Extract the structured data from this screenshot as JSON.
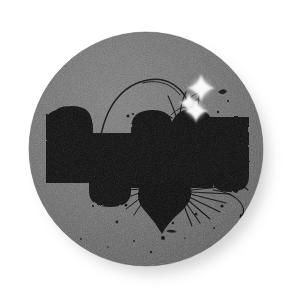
{
  "artwork": {
    "title": "numu",
    "kind": "grunge-sticker-badge",
    "wordmark": "numu",
    "letters": [
      {
        "glyph": "n",
        "name": "letter-n"
      },
      {
        "glyph": "u",
        "name": "letter-u-first"
      },
      {
        "glyph": "m",
        "name": "letter-m"
      },
      {
        "glyph": "u",
        "name": "letter-u-second"
      }
    ],
    "background_color": "#ffffff",
    "badge_color": "#6d6d6d",
    "badge_color_light": "#7b7b7b",
    "badge_color_dark": "#5c5c5c",
    "ink_color": "#0b0b0b",
    "sparkle_color": "#ffffff",
    "shadow_color": "#c9c9c9",
    "badge": {
      "center_x": 146,
      "center_y": 149,
      "radius": 117
    },
    "shadow": {
      "offset_x": 8,
      "offset_y": 10,
      "blur": 9
    },
    "ornaments": [
      {
        "name": "vine-arc",
        "description": "thin curved tendril arcing over the letters"
      },
      {
        "name": "ink-splatter",
        "description": "radiating ink burst below the m"
      },
      {
        "name": "ink-blob-heart",
        "description": "heart-like ink blot under the m"
      },
      {
        "name": "speckles",
        "description": "scattered ink dots across the badge"
      }
    ],
    "sparkles": [
      {
        "name": "sparkle-large",
        "cx": 201,
        "cy": 88,
        "r": 13
      },
      {
        "name": "sparkle-medium",
        "cx": 190,
        "cy": 104,
        "r": 9
      },
      {
        "name": "sparkle-small",
        "cx": 196,
        "cy": 110,
        "r": 11
      }
    ]
  }
}
